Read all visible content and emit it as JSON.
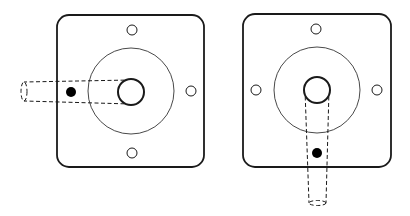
{
  "diagram": {
    "colors": {
      "stroke": "#1a1a1a",
      "background": "#ffffff",
      "dot": "#000000"
    },
    "plates": [
      {
        "id": "left",
        "arm_orientation": "left",
        "plate": {
          "x": 57,
          "y": 15,
          "w": 147,
          "h": 152,
          "r": 12
        },
        "large_circle": {
          "cx": 131,
          "cy": 91,
          "r": 43
        },
        "shaft": {
          "cx": 131,
          "cy": 92,
          "r": 13
        },
        "holes": [
          {
            "cx": 132,
            "cy": 30,
            "r": 5
          },
          {
            "cx": 132,
            "cy": 153,
            "r": 5
          },
          {
            "cx": 191,
            "cy": 91,
            "r": 5
          }
        ],
        "dot": {
          "cx": 71,
          "cy": 92,
          "r": 5
        }
      },
      {
        "id": "right",
        "arm_orientation": "down",
        "plate": {
          "x": 243,
          "y": 14,
          "w": 148,
          "h": 153,
          "r": 12
        },
        "large_circle": {
          "cx": 317,
          "cy": 90,
          "r": 43
        },
        "shaft": {
          "cx": 317,
          "cy": 90,
          "r": 13
        },
        "holes": [
          {
            "cx": 316,
            "cy": 29,
            "r": 5
          },
          {
            "cx": 256,
            "cy": 90,
            "r": 5
          },
          {
            "cx": 377,
            "cy": 90,
            "r": 5
          }
        ],
        "dot": {
          "cx": 317,
          "cy": 153,
          "r": 5
        }
      }
    ]
  }
}
